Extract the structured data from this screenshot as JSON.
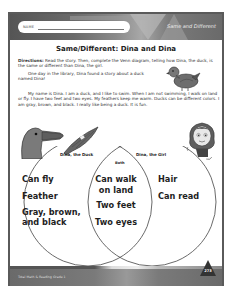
{
  "header": {
    "name_label": "NAME",
    "section_tag": "Same and Different"
  },
  "title": "Same/Different: Dina and Dina",
  "directions": {
    "label": "Directions:",
    "text": " Read the story. Then, complete the Venn diagram, telling how Dina, the duck, is the same or different than Dina, the girl."
  },
  "intro": "One day in the library, Dina found a story about a duck named Dina!",
  "story": "My name is Dina. I am a duck, and I like to swim. When I am not swimming, I walk on land or fly. I have two feet and two eyes. My feathers keep me warm. Ducks can be different colors. I am gray, brown, and black. I really like being a duck. It is fun.",
  "venn": {
    "left_label": "Dina, the Duck",
    "right_label": "Dina, the Girl",
    "center_label": "Both",
    "left_items": [
      "Can fly",
      "Feather",
      "Gray, brown,",
      "and black"
    ],
    "center_items": [
      "Can walk",
      "on land",
      "Two feet",
      "Two eyes"
    ],
    "right_items": [
      "Hair",
      "Can read"
    ]
  },
  "footer": {
    "credit": "Total Math & Reading Grade 1",
    "page_number": "273"
  },
  "icons": {
    "duck": "duck-illustration",
    "girl": "girl-illustration"
  }
}
